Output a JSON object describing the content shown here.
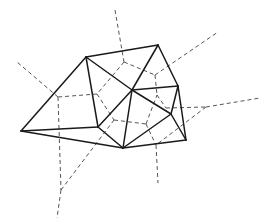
{
  "diagram": {
    "type": "delaunay-voronoi",
    "colors": {
      "solid": "#1a1a1a",
      "dashed": "#555555",
      "background": "#ffffff"
    },
    "points": {
      "A": [
        86,
        57
      ],
      "B": [
        158,
        45
      ],
      "C": [
        178,
        86
      ],
      "D": [
        132,
        90
      ],
      "E": [
        171,
        114
      ],
      "F": [
        186,
        140
      ],
      "G": [
        123,
        148
      ],
      "H": [
        98,
        127
      ],
      "I": [
        21,
        131
      ]
    },
    "delaunay_edges": [
      [
        "A",
        "B"
      ],
      [
        "B",
        "C"
      ],
      [
        "C",
        "F"
      ],
      [
        "F",
        "G"
      ],
      [
        "G",
        "I"
      ],
      [
        "I",
        "A"
      ],
      [
        "A",
        "H"
      ],
      [
        "H",
        "I"
      ],
      [
        "H",
        "G"
      ],
      [
        "A",
        "D"
      ],
      [
        "B",
        "D"
      ],
      [
        "C",
        "D"
      ],
      [
        "D",
        "E"
      ],
      [
        "D",
        "H"
      ],
      [
        "D",
        "G"
      ],
      [
        "E",
        "G"
      ],
      [
        "C",
        "E"
      ],
      [
        "E",
        "F"
      ]
    ],
    "voronoi_nodes": {
      "v1": [
        124,
        62
      ],
      "v2": [
        155,
        75
      ],
      "v3": [
        157,
        95
      ],
      "v4": [
        166,
        108
      ],
      "v5": [
        206,
        107
      ],
      "v6": [
        97,
        94
      ],
      "v7": [
        58,
        97
      ],
      "v8": [
        114,
        120
      ],
      "v9": [
        146,
        124
      ],
      "v10": [
        156,
        145
      ],
      "v11": [
        61,
        190
      ]
    },
    "voronoi_edges": [
      [
        [
          115,
          10
        ],
        [
          124,
          62
        ]
      ],
      [
        [
          124,
          62
        ],
        [
          155,
          75
        ]
      ],
      [
        [
          155,
          75
        ],
        [
          218,
          32
        ]
      ],
      [
        [
          155,
          75
        ],
        [
          157,
          95
        ]
      ],
      [
        [
          124,
          62
        ],
        [
          97,
          94
        ]
      ],
      [
        [
          97,
          94
        ],
        [
          58,
          97
        ]
      ],
      [
        [
          58,
          97
        ],
        [
          17,
          62
        ]
      ],
      [
        [
          58,
          97
        ],
        [
          61,
          190
        ]
      ],
      [
        [
          61,
          190
        ],
        [
          57,
          218
        ]
      ],
      [
        [
          61,
          190
        ],
        [
          114,
          120
        ]
      ],
      [
        [
          97,
          94
        ],
        [
          114,
          120
        ]
      ],
      [
        [
          114,
          120
        ],
        [
          146,
          124
        ]
      ],
      [
        [
          146,
          124
        ],
        [
          157,
          95
        ]
      ],
      [
        [
          157,
          95
        ],
        [
          166,
          108
        ]
      ],
      [
        [
          166,
          108
        ],
        [
          206,
          107
        ]
      ],
      [
        [
          206,
          107
        ],
        [
          260,
          98
        ]
      ],
      [
        [
          206,
          107
        ],
        [
          156,
          145
        ]
      ],
      [
        [
          146,
          124
        ],
        [
          156,
          145
        ]
      ],
      [
        [
          156,
          145
        ],
        [
          158,
          183
        ]
      ]
    ]
  }
}
